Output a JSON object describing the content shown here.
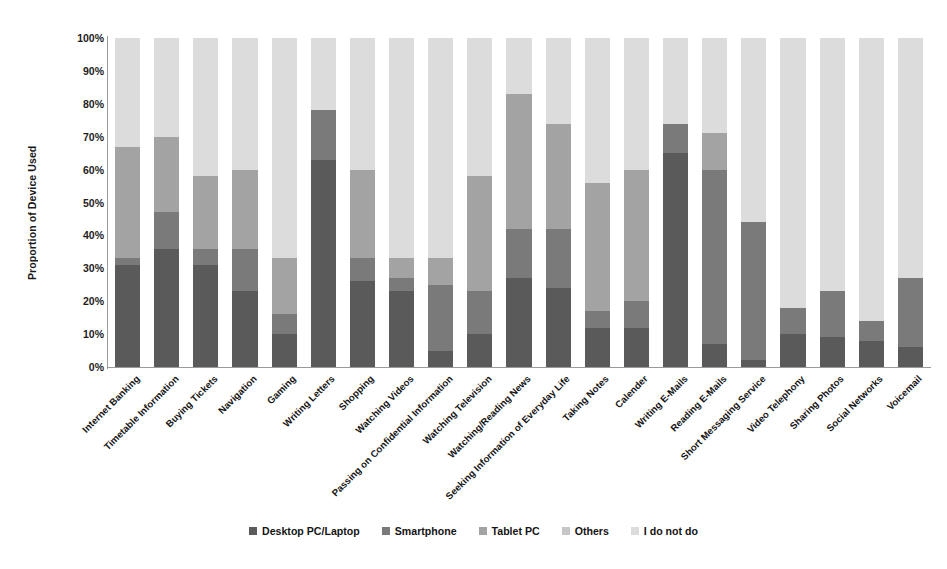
{
  "chart_data": {
    "type": "bar",
    "subtype": "stacked-percentage-column",
    "title": "",
    "xlabel": "",
    "ylabel": "Proportion of Device Used",
    "ylim": [
      0,
      100
    ],
    "grid": false,
    "legend_position": "bottom",
    "y_ticks": [
      "0%",
      "10%",
      "20%",
      "30%",
      "40%",
      "50%",
      "60%",
      "70%",
      "80%",
      "90%",
      "100%"
    ],
    "y_tick_values": [
      0,
      10,
      20,
      30,
      40,
      50,
      60,
      70,
      80,
      90,
      100
    ],
    "categories": [
      "Internet Banking",
      "Timetable Information",
      "Buying Tickets",
      "Navigation",
      "Gaming",
      "Writing Letters",
      "Shopping",
      "Watching Videos",
      "Passing on Confidential Information",
      "Watching Television",
      "Watching/Reading News",
      "Seeking Information of Everyday Life",
      "Taking Notes",
      "Calender",
      "Writing E-Mails",
      "Reading E-Mails",
      "Short Messaging Service",
      "Video Telephony",
      "Sharing Photos",
      "Social Networks",
      "Voicemail"
    ],
    "series": [
      {
        "name": "Desktop PC/Laptop",
        "color": "#5a5a5a",
        "values": [
          31,
          36,
          31,
          23,
          10,
          63,
          26,
          23,
          5,
          10,
          27,
          24,
          12,
          12,
          65,
          7,
          2,
          10,
          9,
          8,
          6
        ]
      },
      {
        "name": "Smartphone",
        "color": "#7a7a7a",
        "values": [
          2,
          11,
          5,
          13,
          6,
          15,
          7,
          4,
          20,
          13,
          15,
          18,
          5,
          8,
          9,
          53,
          42,
          8,
          14,
          6,
          21
        ]
      },
      {
        "name": "Tablet PC",
        "color": "#a3a3a3",
        "values": [
          34,
          23,
          22,
          24,
          17,
          0,
          27,
          6,
          8,
          35,
          41,
          32,
          39,
          40,
          0,
          11,
          0,
          0,
          0,
          0,
          0
        ]
      },
      {
        "name": "Others",
        "color": "#c6c6c6",
        "values": [
          0,
          0,
          0,
          0,
          0,
          0,
          0,
          0,
          0,
          0,
          0,
          0,
          0,
          0,
          0,
          0,
          0,
          0,
          0,
          0,
          0
        ]
      },
      {
        "name": "I do not do",
        "color": "#dcdcdc",
        "values": [
          33,
          30,
          42,
          40,
          67,
          22,
          40,
          67,
          67,
          42,
          17,
          26,
          44,
          40,
          26,
          29,
          56,
          82,
          77,
          86,
          73
        ]
      }
    ]
  },
  "legend": {
    "items": [
      {
        "label": "Desktop PC/Laptop",
        "color": "#5a5a5a"
      },
      {
        "label": "Smartphone",
        "color": "#7a7a7a"
      },
      {
        "label": "Tablet PC",
        "color": "#a3a3a3"
      },
      {
        "label": "Others",
        "color": "#c6c6c6"
      },
      {
        "label": "I do not do",
        "color": "#dcdcdc"
      }
    ]
  },
  "axis": {
    "y_title": "Proportion of Device Used"
  }
}
